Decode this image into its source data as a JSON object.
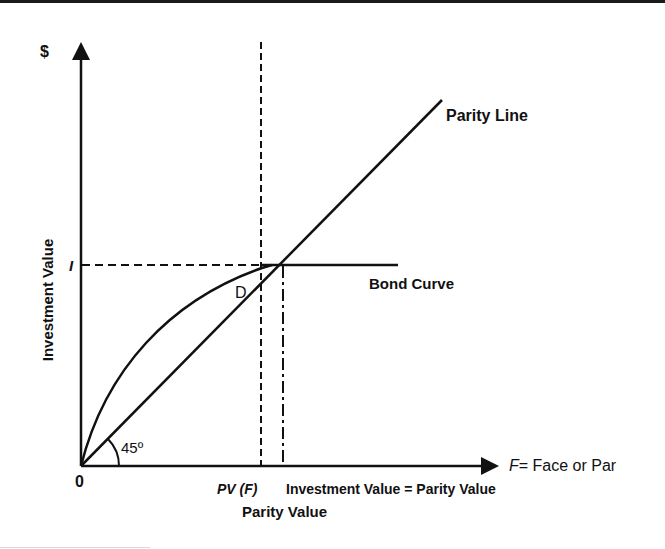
{
  "diagram": {
    "y_axis_symbol": "$",
    "y_axis_label": "Investment Value",
    "y_tick_label": "I",
    "origin_label": "0",
    "x_axis_label_var": "F",
    "x_axis_label_rest": "= Face or Par",
    "x_tick_pv": "PV (F)",
    "x_tick_equal": "Investment Value = Parity Value",
    "x_axis_title": "Parity Value",
    "parity_line_label": "Parity Line",
    "bond_curve_label": "Bond Curve",
    "point_label": "D",
    "angle_label": "45º",
    "colors": {
      "ink": "#111111",
      "background": "#ffffff"
    }
  }
}
